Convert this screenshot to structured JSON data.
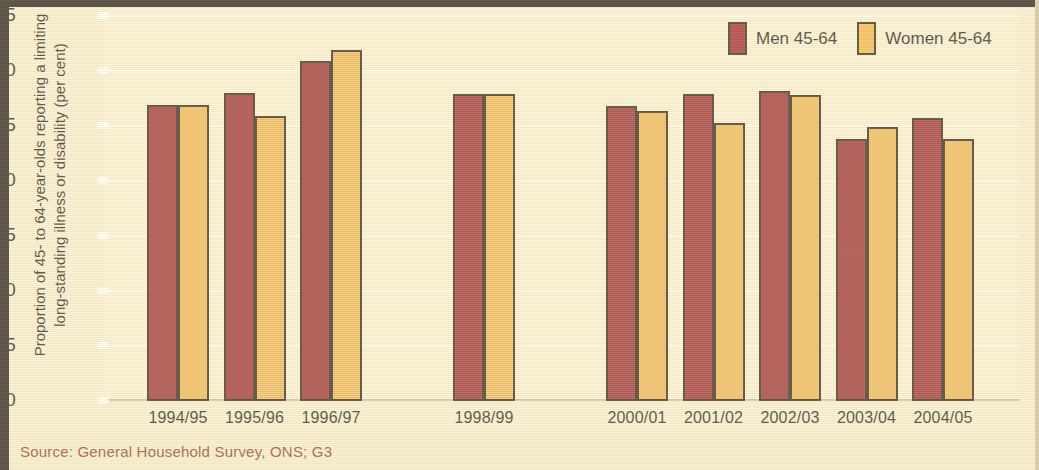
{
  "chart_data": {
    "type": "bar",
    "title": "",
    "xlabel": "",
    "ylabel": "Proportion of 45- to 64-year-olds reporting a limiting long-standing illness or disability (per cent)",
    "ylabel_lines": [
      "Proportion of 45- to 64-year-olds reporting a limiting",
      "long-standing illness or disability (per cent)"
    ],
    "ylim": [
      0,
      35
    ],
    "ytick_step": 5,
    "yticks": [
      0,
      5,
      10,
      15,
      20,
      25,
      30,
      35
    ],
    "ytick_labels": [
      "0",
      "5",
      "10",
      "15",
      "20",
      "25",
      "30",
      "35"
    ],
    "grid": "horizontal",
    "legend_position": "top-right",
    "categories": [
      "1994/95",
      "1995/96",
      "1996/97",
      "1998/99",
      "2000/01",
      "2001/02",
      "2002/03",
      "2003/04",
      "2004/05"
    ],
    "missing_years": [
      "1997/98",
      "1999/00"
    ],
    "series": [
      {
        "name": "Men 45-64",
        "color": "#9e2022",
        "values": [
          26.9,
          28.0,
          30.9,
          27.9,
          26.8,
          27.9,
          28.2,
          23.8,
          25.7
        ]
      },
      {
        "name": "Women 45-64",
        "color": "#f3b43f",
        "values": [
          26.9,
          25.9,
          31.9,
          27.9,
          26.4,
          25.3,
          27.8,
          24.9,
          23.8
        ]
      }
    ]
  },
  "legend": {
    "entries": [
      {
        "label": "Men 45-64",
        "swatch": "men-swatch"
      },
      {
        "label": "Women 45-64",
        "swatch": "women-swatch"
      }
    ]
  },
  "source": {
    "text": "Source: General Household Survey, ONS; G3"
  },
  "colors": {
    "men": "#9e2022",
    "women": "#f3b43f",
    "background": "#f7eecb",
    "plot_background": "#f8f0cf",
    "gridline": "#fdfaec",
    "bar_outline": "#2b1d10",
    "source_text": "#8d3b22"
  }
}
